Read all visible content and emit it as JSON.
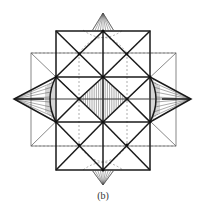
{
  "figure": {
    "caption": "(b)",
    "colors": {
      "line": "#1a1a1a",
      "thin_line": "#555555",
      "dashed_line": "#777777",
      "background": "#ffffff"
    },
    "elements": [
      "outer-thin-square",
      "inner-bold-square",
      "diagonals",
      "central-hatched-diamond",
      "left-hatched-spike",
      "right-hatched-spike",
      "top-hatched-spike",
      "bottom-hatched-spike",
      "dashed-auxiliary-lines",
      "dashed-ellipse-arcs"
    ]
  }
}
